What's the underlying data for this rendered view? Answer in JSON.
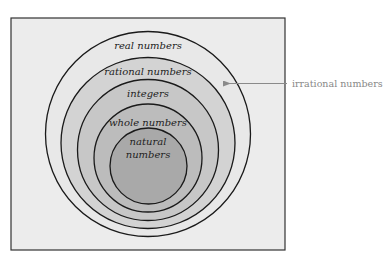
{
  "diagram": {
    "type": "nested-sets",
    "title": "",
    "colors": {
      "frame_fill": "#ececec",
      "frame_stroke": "#333333",
      "circle_stroke": "#1a1a1a",
      "real_fill": "#e6e6e6",
      "rational_fill": "#d2d2d2",
      "integers_fill": "#c6c6c6",
      "whole_fill": "#bababa",
      "natural_fill": "#a8a8a8",
      "callout_color": "#8a8a8a"
    },
    "sets": [
      {
        "id": "real",
        "label": "real numbers"
      },
      {
        "id": "rational",
        "label": "rational numbers"
      },
      {
        "id": "integers",
        "label": "integers"
      },
      {
        "id": "whole",
        "label": "whole numbers"
      },
      {
        "id": "natural",
        "label_line1": "natural",
        "label_line2": "numbers"
      }
    ],
    "callout": {
      "label": "irrational numbers",
      "points_to": "real minus rational region"
    }
  }
}
